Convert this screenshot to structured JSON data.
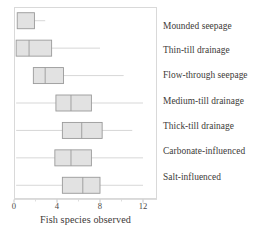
{
  "chart_data": {
    "type": "boxplot",
    "title": "",
    "xlabel": "Fish species observed",
    "ylabel": "",
    "xlim": [
      0,
      12.8
    ],
    "xticks": [
      0,
      4,
      8,
      12
    ],
    "xticklabels": [
      "0",
      "4",
      "8",
      "12"
    ],
    "grid": false,
    "legend": null,
    "orientation": "horizontal",
    "categories": [
      "Mounded seepage",
      "Thin-till drainage",
      "Flow-through seepage",
      "Medium-till drainage",
      "Thick-till drainage",
      "Carbonate-influenced",
      "Salt-influenced"
    ],
    "boxes": [
      {
        "category": "Mounded seepage",
        "whisker_low": 0.3,
        "q1": 0.3,
        "median": 0.3,
        "q3": 1.9,
        "whisker_high": 2.9
      },
      {
        "category": "Thin-till drainage",
        "whisker_low": 0.2,
        "q1": 0.2,
        "median": 1.4,
        "q3": 3.5,
        "whisker_high": 8.0
      },
      {
        "category": "Flow-through seepage",
        "whisker_low": 1.8,
        "q1": 1.8,
        "median": 2.9,
        "q3": 4.6,
        "whisker_high": 10.2
      },
      {
        "category": "Medium-till drainage",
        "whisker_low": 0.2,
        "q1": 3.9,
        "median": 5.3,
        "q3": 7.2,
        "whisker_high": 12.0
      },
      {
        "category": "Thick-till drainage",
        "whisker_low": 0.2,
        "q1": 4.5,
        "median": 6.3,
        "q3": 8.2,
        "whisker_high": 11.0
      },
      {
        "category": "Carbonate-influenced",
        "whisker_low": 0.2,
        "q1": 3.8,
        "median": 5.3,
        "q3": 7.2,
        "whisker_high": 12.0
      },
      {
        "category": "Salt-influenced",
        "whisker_low": 0.2,
        "q1": 4.5,
        "median": 6.4,
        "q3": 8.0,
        "whisker_high": 12.0
      }
    ],
    "colors": {
      "box_fill": "#e2e2e2",
      "box_edge": "#9a9a9a",
      "median_line": "#9a9a9a",
      "whisker": "#d3d3d3",
      "frame": "#d9d9d9",
      "text": "#3d3a38"
    }
  },
  "axis": {
    "xlabel": "Fish species observed",
    "tick_labels": [
      "0",
      "4",
      "8",
      "12"
    ]
  },
  "labels": {
    "row_0": "Mounded seepage",
    "row_1": "Thin-till drainage",
    "row_2": "Flow-through seepage",
    "row_3": "Medium-till drainage",
    "row_4": "Thick-till drainage",
    "row_5": "Carbonate-influenced",
    "row_6": "Salt-influenced"
  }
}
